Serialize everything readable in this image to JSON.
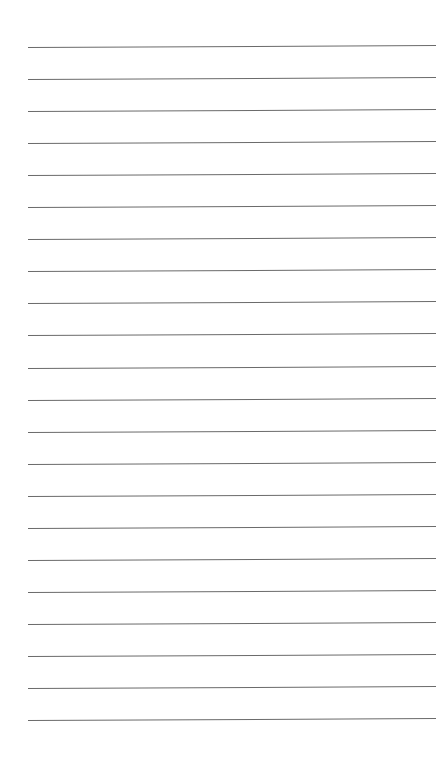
{
  "page": {
    "type": "lined-paper",
    "background": "#ffffff",
    "line_color": "#6a6a6a",
    "line_count": 22,
    "first_line_y": 47,
    "line_spacing": 32.05,
    "line_left": 28,
    "line_right": 436
  }
}
